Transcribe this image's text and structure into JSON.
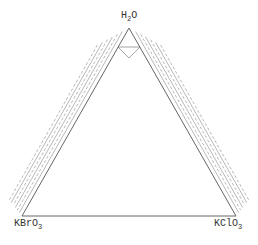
{
  "diagram": {
    "type": "ternary-phase-diagram",
    "vertices": {
      "top": {
        "label": "H",
        "sub": "2",
        "rest": "O",
        "x": 129,
        "y": 28
      },
      "left": {
        "label": "KBrO",
        "sub": "3",
        "x": 22,
        "y": 216
      },
      "right": {
        "label": "KClO",
        "sub": "3",
        "x": 236,
        "y": 216
      }
    },
    "line_color": "#555555",
    "tie_line_color": "#888888",
    "left_band_offsets": [
      4,
      7,
      10,
      13,
      16,
      19
    ],
    "right_band_offsets": [
      4,
      7,
      10,
      13,
      16,
      19
    ]
  }
}
